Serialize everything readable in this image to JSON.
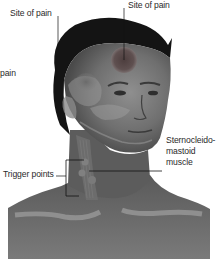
{
  "figure": {
    "colors": {
      "background": "#ffffff",
      "skin_dark": "#4a4a4a",
      "skin_mid": "#6e6e6e",
      "skin_light": "#9a9a9a",
      "hair": "#141414",
      "pain_site": "#5a4848",
      "leader_line": "#111111",
      "text": "#2a2a2a"
    },
    "labels": {
      "site_of_pain_left": "Site of pain",
      "site_of_pain_right": "Site of pain",
      "pain_partial": "pain",
      "muscle_line1": "Sternocleido-",
      "muscle_line2": "mastoid",
      "muscle_line3": "muscle",
      "trigger_points": "Trigger points"
    }
  }
}
